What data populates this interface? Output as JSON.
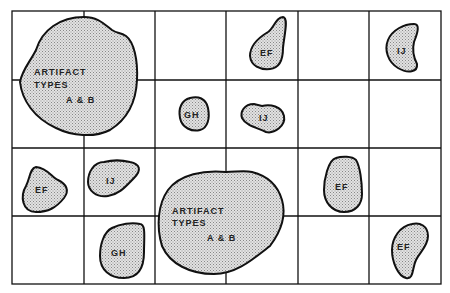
{
  "diagram": {
    "grid": {
      "columns": 6,
      "rows": 4
    },
    "fill_color": "#d4d4d4",
    "line_color": "#111111",
    "clusters": [
      {
        "id": "ab1",
        "label_lines": [
          "ARTIFACT",
          "TYPES",
          "A & B"
        ],
        "cell": "r1-2 c1-2"
      },
      {
        "id": "ef1",
        "label_lines": [
          "EF"
        ],
        "cell": "r1 c4"
      },
      {
        "id": "ij1",
        "label_lines": [
          "IJ"
        ],
        "cell": "r1 c6"
      },
      {
        "id": "gh1",
        "label_lines": [
          "GH"
        ],
        "cell": "r2 c3"
      },
      {
        "id": "ij2",
        "label_lines": [
          "IJ"
        ],
        "cell": "r2 c4"
      },
      {
        "id": "ef2",
        "label_lines": [
          "EF"
        ],
        "cell": "r3 c1"
      },
      {
        "id": "ij3",
        "label_lines": [
          "IJ"
        ],
        "cell": "r3 c2"
      },
      {
        "id": "ab2",
        "label_lines": [
          "ARTIFACT",
          "TYPES",
          "A & B"
        ],
        "cell": "r3-4 c3-4"
      },
      {
        "id": "ef3",
        "label_lines": [
          "EF"
        ],
        "cell": "r3 c5"
      },
      {
        "id": "gh2",
        "label_lines": [
          "GH"
        ],
        "cell": "r4 c2"
      },
      {
        "id": "ef4",
        "label_lines": [
          "EF"
        ],
        "cell": "r4 c6"
      }
    ]
  }
}
